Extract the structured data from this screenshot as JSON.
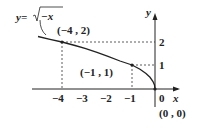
{
  "function_label": {
    "lhs": "y=",
    "radicand": "−x"
  },
  "axes": {
    "x_label": "x",
    "y_label": "y",
    "origin_label": "0"
  },
  "x_ticks": [
    "−4",
    "−3",
    "−2",
    "−1"
  ],
  "y_ticks": [
    "1",
    "2"
  ],
  "points": [
    {
      "label": "(−4 , 2)",
      "x": -4,
      "y": 2
    },
    {
      "label": "(−1 , 1)",
      "x": -1,
      "y": 1
    },
    {
      "label": "(0 , 0)",
      "x": 0,
      "y": 0
    }
  ],
  "colors": {
    "ink": "#222222",
    "curve": "#222222"
  }
}
